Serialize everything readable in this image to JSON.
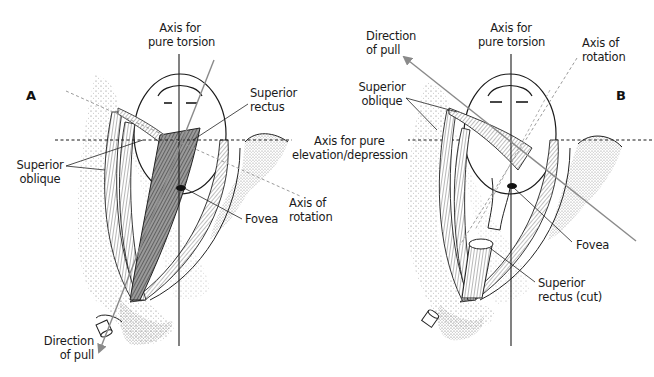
{
  "figure": {
    "panels": [
      {
        "id": "A",
        "label": "A",
        "annotations": {
          "axis_torsion": [
            "Axis for",
            "pure torsion"
          ],
          "superior_rectus": [
            "Superior",
            "rectus"
          ],
          "superior_oblique": [
            "Superior",
            "oblique"
          ],
          "axis_elev": [
            "Axis for pure",
            "elevation/depression"
          ],
          "axis_rotation": [
            "Axis of",
            "rotation"
          ],
          "fovea": "Fovea",
          "direction_of_pull": [
            "Direction",
            "of pull"
          ]
        }
      },
      {
        "id": "B",
        "label": "B",
        "annotations": {
          "direction_of_pull": [
            "Direction",
            "of pull"
          ],
          "axis_torsion": [
            "Axis for",
            "pure torsion"
          ],
          "axis_rotation": [
            "Axis of",
            "rotation"
          ],
          "superior_oblique": [
            "Superior",
            "oblique"
          ],
          "fovea": "Fovea",
          "superior_rectus_cut": [
            "Superior",
            "rectus (cut)"
          ]
        }
      }
    ],
    "colors": {
      "line": "#1a1a1a",
      "pull_arrow": "#8a8a8a",
      "dashed_axis": "#9a9a9a",
      "muscle_dark": "#555555",
      "stipple": "#b0b0b0"
    }
  }
}
